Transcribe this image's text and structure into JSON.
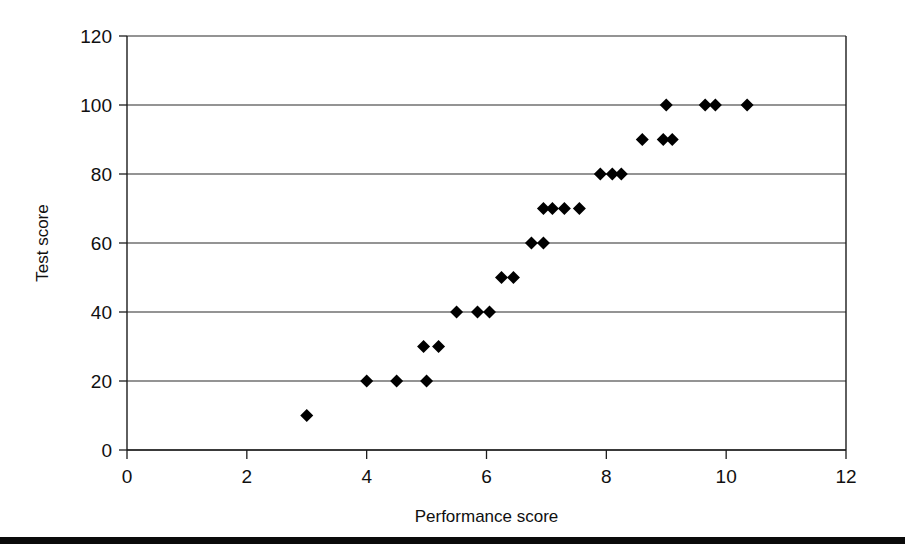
{
  "chart_data": {
    "type": "scatter",
    "title": "",
    "xlabel": "Performance score",
    "ylabel": "Test score",
    "xlim": [
      0,
      12
    ],
    "ylim": [
      0,
      120
    ],
    "xticks": [
      0,
      2,
      4,
      6,
      8,
      10,
      12
    ],
    "yticks": [
      0,
      20,
      40,
      60,
      80,
      100,
      120
    ],
    "xtick_labels": [
      "0",
      "2",
      "4",
      "6",
      "8",
      "10",
      "12"
    ],
    "ytick_labels": [
      "0",
      "20",
      "40",
      "60",
      "80",
      "100",
      "120"
    ],
    "grid": "horizontal",
    "legend": "none",
    "marker": "diamond",
    "marker_color": "#000000",
    "marker_size": 13,
    "series": [
      {
        "name": "observations",
        "points": [
          [
            3.0,
            10
          ],
          [
            4.0,
            20
          ],
          [
            4.5,
            20
          ],
          [
            5.0,
            20
          ],
          [
            4.95,
            30
          ],
          [
            5.2,
            30
          ],
          [
            5.5,
            40
          ],
          [
            5.85,
            40
          ],
          [
            6.05,
            40
          ],
          [
            6.25,
            50
          ],
          [
            6.45,
            50
          ],
          [
            6.75,
            60
          ],
          [
            6.95,
            60
          ],
          [
            6.95,
            70
          ],
          [
            7.1,
            70
          ],
          [
            7.3,
            70
          ],
          [
            7.55,
            70
          ],
          [
            7.9,
            80
          ],
          [
            8.1,
            80
          ],
          [
            8.25,
            80
          ],
          [
            8.6,
            90
          ],
          [
            8.95,
            90
          ],
          [
            9.1,
            90
          ],
          [
            9.0,
            100
          ],
          [
            9.65,
            100
          ],
          [
            9.82,
            100
          ],
          [
            10.35,
            100
          ]
        ]
      }
    ]
  },
  "axes": {
    "y_title": "Test score",
    "x_title": "Performance score"
  }
}
